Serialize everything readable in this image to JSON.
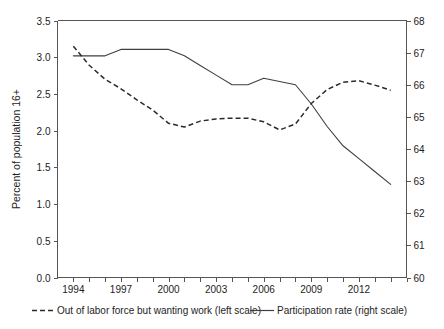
{
  "chart_data": {
    "type": "line",
    "title": "",
    "subtitle": "",
    "xlabel": "",
    "ylabel": "Percent of population 16+",
    "y2label": "",
    "x": [
      1994,
      1995,
      1996,
      1997,
      1998,
      1999,
      2000,
      2001,
      2002,
      2003,
      2004,
      2005,
      2006,
      2007,
      2008,
      2009,
      2010,
      2011,
      2012,
      2013,
      2014
    ],
    "xlim": [
      1993,
      2015
    ],
    "xticks": [
      1994,
      1995,
      1996,
      1997,
      1998,
      1999,
      2000,
      2001,
      2002,
      2003,
      2004,
      2005,
      2006,
      2007,
      2008,
      2009,
      2010,
      2011,
      2012,
      2013,
      2014,
      2015
    ],
    "xtick_labels": [
      "1994",
      "1997",
      "2000",
      "2003",
      "2006",
      "2009",
      "2012"
    ],
    "xtick_label_values": [
      1994,
      1997,
      2000,
      2003,
      2006,
      2009,
      2012
    ],
    "ylim": [
      0.0,
      3.5
    ],
    "yticks": [
      0.0,
      0.5,
      1.0,
      1.5,
      2.0,
      2.5,
      3.0,
      3.5
    ],
    "ytick_labels": [
      "0.0",
      "0.5",
      "1.0",
      "1.5",
      "2.0",
      "2.5",
      "3.0",
      "3.5"
    ],
    "y2lim": [
      60,
      68
    ],
    "y2ticks": [
      60,
      61,
      62,
      63,
      64,
      65,
      66,
      67,
      68
    ],
    "y2tick_labels": [
      "60",
      "61",
      "62",
      "63",
      "64",
      "65",
      "66",
      "67",
      "68"
    ],
    "grid": false,
    "legend_position": "bottom",
    "series": [
      {
        "name": "Out of labor force but wanting work (left scale)",
        "axis": "left",
        "style": "dashed",
        "color": "#2b2b2b",
        "values": [
          3.15,
          2.89,
          2.7,
          2.57,
          2.42,
          2.28,
          2.1,
          2.05,
          2.13,
          2.16,
          2.17,
          2.17,
          2.12,
          2.01,
          2.09,
          2.37,
          2.56,
          2.66,
          2.68,
          2.62,
          2.55
        ]
      },
      {
        "name": "Participation rate (right scale)",
        "axis": "right",
        "style": "solid",
        "color": "#3f3f3f",
        "values": [
          66.9,
          66.9,
          66.9,
          67.1,
          67.1,
          67.1,
          67.1,
          66.9,
          66.6,
          66.3,
          66.0,
          66.0,
          66.2,
          66.1,
          66.0,
          65.4,
          64.7,
          64.1,
          63.7,
          63.3,
          62.9
        ]
      }
    ],
    "legend": [
      {
        "label": "Out of labor force but wanting work (left scale)",
        "marker": "dashed-line",
        "color": "#2b2b2b"
      },
      {
        "label": "Participation rate (right scale)",
        "marker": "solid-line",
        "color": "#3f3f3f"
      }
    ]
  }
}
